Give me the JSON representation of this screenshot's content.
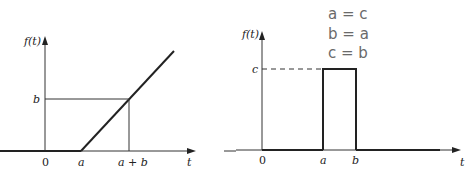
{
  "figure": {
    "left_graph": {
      "y_axis_label": "f(t)",
      "x_axis_label": "t",
      "origin_label": "0",
      "tick_labels_x": [
        "a",
        "a + b"
      ],
      "tick_labels_y": [
        "b"
      ],
      "description": "Ramp function: zero until t=a, then rises linearly with slope 1, reaching value b at t=a+b"
    },
    "right_graph": {
      "y_axis_label": "f(t)",
      "x_axis_label": "t",
      "origin_label": "0",
      "tick_labels_x": [
        "a",
        "b"
      ],
      "tick_labels_y": [
        "c"
      ],
      "description": "Rectangular pulse of height c from t=a to t=b, dashed guide to c"
    },
    "handwritten_notes": [
      "a = c",
      "b = a",
      "c = b"
    ],
    "colors": {
      "line": "#222222",
      "handwriting": "#6a6a6a"
    }
  }
}
